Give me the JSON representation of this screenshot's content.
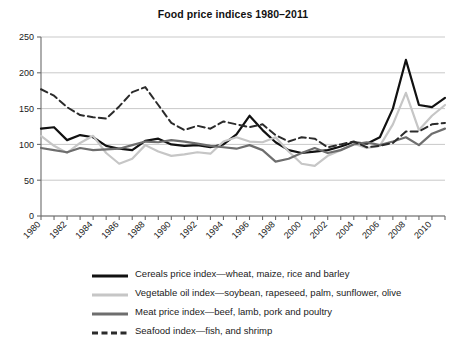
{
  "chart_data": {
    "type": "line",
    "title": "Food price indices 1980–2011",
    "xlabel": "",
    "ylabel": "",
    "xlim": [
      1980,
      2011
    ],
    "ylim": [
      0,
      250
    ],
    "yticks": [
      0,
      50,
      100,
      150,
      200,
      250
    ],
    "xticks": [
      1980,
      1981,
      1982,
      1983,
      1984,
      1985,
      1986,
      1987,
      1988,
      1989,
      1990,
      1991,
      1992,
      1993,
      1994,
      1995,
      1996,
      1997,
      1998,
      1999,
      2000,
      2001,
      2002,
      2003,
      2004,
      2005,
      2006,
      2007,
      2008,
      2009,
      2010,
      2011
    ],
    "xtick_labels": [
      "1980",
      "",
      "1982",
      "",
      "1984",
      "",
      "1986",
      "",
      "1988",
      "",
      "1990",
      "",
      "1992",
      "",
      "1994",
      "",
      "1996",
      "",
      "1998",
      "",
      "2000",
      "",
      "2002",
      "",
      "2004",
      "",
      "2006",
      "",
      "2008",
      "",
      "2010",
      ""
    ],
    "grid": "horizontal",
    "legend_position": "below",
    "x": [
      1980,
      1981,
      1982,
      1983,
      1984,
      1985,
      1986,
      1987,
      1988,
      1989,
      1990,
      1991,
      1992,
      1993,
      1994,
      1995,
      1996,
      1997,
      1998,
      1999,
      2000,
      2001,
      2002,
      2003,
      2004,
      2005,
      2006,
      2007,
      2008,
      2009,
      2010,
      2011
    ],
    "series": [
      {
        "name": "Cereals price index—wheat, maize, rice and barley",
        "color": "#111111",
        "width": 2.2,
        "dash": "none",
        "values": [
          122,
          124,
          106,
          113,
          110,
          98,
          94,
          92,
          105,
          108,
          100,
          98,
          99,
          96,
          100,
          114,
          140,
          120,
          103,
          92,
          88,
          90,
          92,
          97,
          103,
          101,
          110,
          150,
          218,
          155,
          152,
          165
        ]
      },
      {
        "name": "Vegetable oil index—soybean, rapeseed, palm, sunflower, olive",
        "color": "#c6c6c6",
        "width": 2.2,
        "dash": "none",
        "values": [
          112,
          98,
          88,
          102,
          112,
          88,
          73,
          80,
          99,
          90,
          84,
          86,
          89,
          87,
          104,
          110,
          104,
          103,
          110,
          90,
          73,
          70,
          84,
          92,
          101,
          95,
          98,
          128,
          172,
          120,
          140,
          155
        ]
      },
      {
        "name": "Meat price index—beef, lamb, pork and poultry",
        "color": "#6e6e6e",
        "width": 2.2,
        "dash": "none",
        "values": [
          95,
          92,
          89,
          95,
          92,
          93,
          94,
          99,
          104,
          103,
          106,
          104,
          101,
          98,
          96,
          94,
          99,
          92,
          76,
          80,
          88,
          95,
          88,
          92,
          100,
          103,
          99,
          104,
          110,
          99,
          115,
          122
        ]
      },
      {
        "name": "Seafood index—fish, and shrimp",
        "color": "#2b2b2b",
        "width": 2.0,
        "dash": "7,4",
        "values": [
          177,
          168,
          152,
          141,
          138,
          136,
          153,
          173,
          180,
          155,
          130,
          120,
          126,
          122,
          132,
          128,
          124,
          128,
          113,
          104,
          110,
          108,
          96,
          100,
          104,
          96,
          98,
          102,
          118,
          118,
          128,
          130
        ]
      }
    ]
  },
  "legend": {
    "items": [
      {
        "label": "Cereals price index—wheat, maize, rice and barley",
        "color": "#111111",
        "thickness": 3,
        "dashed": false
      },
      {
        "label": "Vegetable oil index—soybean, rapeseed, palm, sunflower, olive",
        "color": "#c6c6c6",
        "thickness": 3,
        "dashed": false
      },
      {
        "label": "Meat price index—beef, lamb, pork and poultry",
        "color": "#6e6e6e",
        "thickness": 3,
        "dashed": false
      },
      {
        "label": "Seafood index—fish, and shrimp",
        "color": "#2b2b2b",
        "thickness": 3,
        "dashed": true
      }
    ]
  },
  "axes": {
    "axis_color": "#6b6b6b",
    "grid_color": "#c9c9c9"
  }
}
